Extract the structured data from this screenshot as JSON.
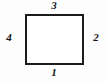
{
  "diagram": {
    "type": "rectangle-with-side-labels",
    "shape": {
      "name": "rectangle",
      "stroke_color": "#1c1c1c",
      "fill_color": "#ffffff",
      "stroke_width_px": 2
    },
    "background_color": "#fdfdfd",
    "labels": [
      {
        "position": "top",
        "text": "3"
      },
      {
        "position": "right",
        "text": "2"
      },
      {
        "position": "bottom",
        "text": "1"
      },
      {
        "position": "left",
        "text": "4"
      }
    ]
  }
}
